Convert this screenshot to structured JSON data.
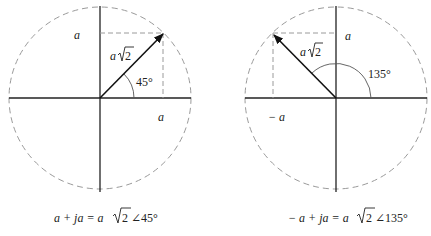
{
  "diagrams": [
    {
      "id": "phasor-45",
      "labels": {
        "imag_a": "a",
        "real_a": "a",
        "magnitude_a": "a",
        "magnitude_sqrt": "2",
        "angle": "45°"
      },
      "caption": {
        "lhs": "a + ja = a",
        "sqrt": "2",
        "rhs": "∠45°"
      }
    },
    {
      "id": "phasor-135",
      "labels": {
        "imag_a": "a",
        "real_a": "− a",
        "magnitude_a": "a",
        "magnitude_sqrt": "2",
        "angle": "135°"
      },
      "caption": {
        "lhs": "− a + ja = a",
        "sqrt": "2",
        "rhs": "∠135°"
      }
    }
  ],
  "colors": {
    "axis": "#222222",
    "dashed": "#9a9a9a",
    "vector": "#111111"
  }
}
